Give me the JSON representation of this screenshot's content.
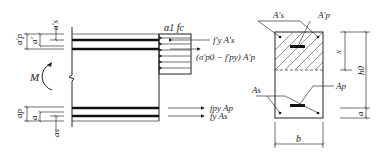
{
  "diagram": {
    "left_view": {
      "moment_label": "M",
      "top_dims": [
        "a'p",
        "a'",
        "a's"
      ],
      "bottom_dims": [
        "ap",
        "a",
        "as"
      ],
      "forces": {
        "concrete": "α1 fc",
        "top_steel": "f'y A's",
        "top_prestress": "(σ'p0 − f'py) A'p",
        "bottom_prestress": "fpy Ap",
        "bottom_steel": "fy As"
      }
    },
    "right_view": {
      "labels": {
        "top_steel": "A's",
        "top_prestress": "A'p",
        "bottom_steel": "As",
        "bottom_prestress": "Ap",
        "compression_depth": "x",
        "effective_depth": "h0",
        "cover": "a",
        "width": "b"
      }
    }
  }
}
